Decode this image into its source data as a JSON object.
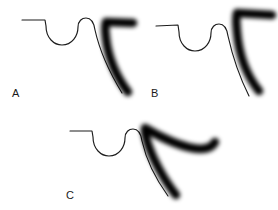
{
  "figure": {
    "background_color": "#ffffff",
    "thin_stroke_color": "#1c1c1c",
    "thick_stroke_color": "#000000",
    "label_color": "#1a1a1a",
    "panel_count": 3
  },
  "panels": [
    {
      "id": "panel-a",
      "label": "A",
      "label_x": 12,
      "label_y": 88,
      "thin_curve": {
        "name": "wavy-profile-curve",
        "path": "M 22 20 L 45 20 L 46 26 C 46 38 54 45 62 45 C 72 45 78 36 78 27 C 78 21 82 18 86 18 C 91 18 94 23 95 30 C 99 48 108 70 122 93"
      },
      "thick_arrow": {
        "name": "thick-arrow-stroke",
        "path": "M 128 92 C 117 78 108 58 106 38 C 105 30 105 25 106 22 L 133 23",
        "stroke_width": 8.5
      }
    },
    {
      "id": "panel-b",
      "label": "B",
      "label_x": 151,
      "label_y": 88,
      "thin_curve": {
        "name": "wavy-profile-curve",
        "path": "M 156 26 L 178 25 L 179 32 C 179 44 187 51 195 51 C 205 51 211 42 211 33 C 211 27 215 24 219 24 C 224 24 227 29 228 36 C 232 54 238 74 249 96"
      },
      "thick_arrow": {
        "name": "thick-arrow-stroke",
        "path": "M 259 91 C 247 76 239 55 237 32 C 236 22 236 16 237 13 L 272 15",
        "stroke_width": 8.5
      }
    },
    {
      "id": "panel-c",
      "label": "C",
      "label_x": 66,
      "label_y": 190,
      "thin_curve": {
        "name": "wavy-profile-curve",
        "path": "M 70 131 L 92 131 L 93 137 C 93 149 101 156 109 156 C 119 156 125 147 125 138 C 125 132 129 129 133 129 C 138 129 141 134 142 141 C 146 159 155 178 168 196"
      },
      "thick_arrow": {
        "name": "thick-arrow-stroke",
        "path": "M 176 195 C 164 180 152 158 147 141 C 145 134 144 130 145 128 C 160 137 183 148 200 149 C 209 149 213 146 215 142",
        "stroke_width": 8.5
      }
    }
  ]
}
